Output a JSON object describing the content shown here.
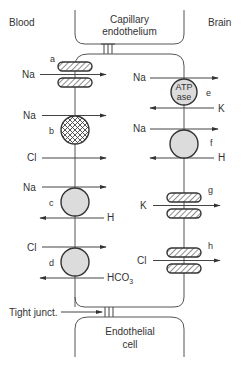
{
  "labels": {
    "blood": "Blood",
    "brain": "Brain",
    "capillary_line1": "Capillary",
    "capillary_line2": "endothelium",
    "endothelial_line1": "Endothelial",
    "endothelial_line2": "cell",
    "tight_junction": "Tight junct."
  },
  "transporters": {
    "a": {
      "letter": "a",
      "type": "channel",
      "ions": [
        {
          "ion": "Na",
          "direction": "blood-to-cell"
        }
      ]
    },
    "b": {
      "letter": "b",
      "type": "cotransporter-crosshatch",
      "ions": [
        {
          "ion": "Na",
          "direction": "blood-to-cell"
        },
        {
          "ion": "Cl",
          "direction": "blood-to-cell"
        }
      ]
    },
    "c": {
      "letter": "c",
      "type": "exchanger",
      "ions": [
        {
          "ion": "Na",
          "direction": "blood-to-cell"
        },
        {
          "ion": "H",
          "direction": "cell-to-blood"
        }
      ]
    },
    "d": {
      "letter": "d",
      "type": "exchanger",
      "ions": [
        {
          "ion": "Cl",
          "direction": "blood-to-cell"
        },
        {
          "ion": "HCO",
          "sub": "3",
          "direction": "cell-to-blood"
        }
      ]
    },
    "e": {
      "letter": "e",
      "type": "ATPase",
      "pump_line1": "ATP",
      "pump_line2": "ase",
      "ions": [
        {
          "ion": "Na",
          "direction": "cell-to-brain"
        },
        {
          "ion": "K",
          "direction": "brain-to-cell"
        }
      ]
    },
    "f": {
      "letter": "f",
      "type": "exchanger",
      "ions": [
        {
          "ion": "Na",
          "direction": "cell-to-brain"
        },
        {
          "ion": "H",
          "direction": "brain-to-cell"
        }
      ]
    },
    "g": {
      "letter": "g",
      "type": "channel",
      "ions": [
        {
          "ion": "K",
          "direction": "cell-to-brain"
        }
      ]
    },
    "h": {
      "letter": "h",
      "type": "channel",
      "ions": [
        {
          "ion": "Cl",
          "direction": "cell-to-brain"
        }
      ]
    }
  },
  "colors": {
    "line": "#444444",
    "transporter_fill": "#dcdcdc"
  }
}
